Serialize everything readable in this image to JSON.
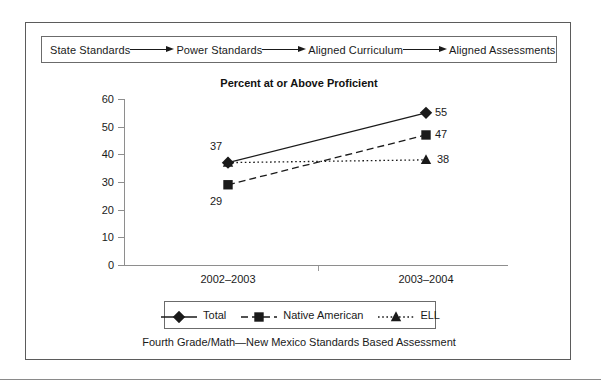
{
  "flow": {
    "steps": [
      "State Standards",
      "Power Standards",
      "Aligned Curriculum",
      "Aligned Assessments"
    ],
    "arrow_icon": "right-arrow-icon"
  },
  "chart_data": {
    "type": "line",
    "title": "Percent at or Above Proficient",
    "xlabel": "",
    "ylabel": "",
    "categories": [
      "2002–2003",
      "2003–2004"
    ],
    "yticks": [
      0,
      10,
      20,
      30,
      40,
      50,
      60
    ],
    "ylim": [
      0,
      60
    ],
    "grid": false,
    "legend_position": "bottom",
    "series": [
      {
        "name": "Total",
        "values": [
          37,
          55
        ],
        "marker": "diamond",
        "line_style": "solid",
        "color": "#1a1a1a",
        "labels": [
          "37",
          "55"
        ]
      },
      {
        "name": "Native American",
        "values": [
          29,
          47
        ],
        "marker": "square",
        "line_style": "dashed",
        "color": "#1a1a1a",
        "labels": [
          "29",
          "47"
        ]
      },
      {
        "name": "ELL",
        "values": [
          37,
          38
        ],
        "marker": "triangle",
        "line_style": "dotted",
        "color": "#1a1a1a",
        "labels": [
          "",
          "38"
        ]
      }
    ]
  },
  "caption": "Fourth Grade/Math—New Mexico Standards Based Assessment",
  "colors": {
    "ink": "#1a1a1a",
    "axis": "#8e8e8e",
    "frame": "#5b5b5b",
    "rule": "#8a8a8a"
  }
}
